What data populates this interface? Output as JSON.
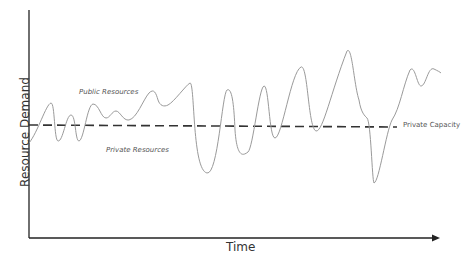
{
  "diagram": {
    "axes": {
      "y_label": "Resource Demand",
      "x_label": "Time"
    },
    "annotations": {
      "public": "Public Resources",
      "private": "Private Resources",
      "capacity": "Private Capacity"
    },
    "colors": {
      "axis": "#222222",
      "curve": "#9a9a9a",
      "capacity_line": "#333333"
    }
  }
}
